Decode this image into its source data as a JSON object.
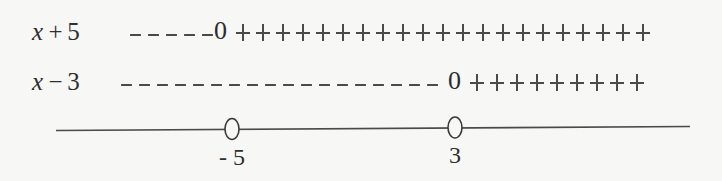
{
  "figure": {
    "type": "sign-chart",
    "background_color": "#f7f7f5",
    "ink_color": "#3a3a3a",
    "rows": [
      {
        "label_variable": "x",
        "label_operator": "+",
        "label_constant": "5",
        "label_text": "x + 5",
        "negative_dash_count": 5,
        "zero_text": "0",
        "zero_at": "-5",
        "positive_plus_count": 21
      },
      {
        "label_variable": "x",
        "label_operator": "−",
        "label_constant": "3",
        "label_text": "x − 3",
        "negative_dash_count": 18,
        "zero_text": "0",
        "zero_at": "3",
        "positive_plus_count": 9
      }
    ],
    "number_line": {
      "marks": [
        {
          "label": "- 5",
          "open_circle": true
        },
        {
          "label": "3",
          "open_circle": true
        }
      ]
    }
  },
  "chart_data": {
    "type": "table",
    "title": "",
    "xlabel": "",
    "ylabel": "",
    "categories": [
      "x + 5",
      "x − 3"
    ],
    "series": [
      {
        "name": "x + 5",
        "zeros": [
          -5
        ],
        "sign_intervals": [
          {
            "interval": "(-∞, -5)",
            "sign": "-"
          },
          {
            "interval": "-5",
            "sign": "0"
          },
          {
            "interval": "(-5, ∞)",
            "sign": "+"
          }
        ],
        "dash_count": 5,
        "plus_count": 21
      },
      {
        "name": "x − 3",
        "zeros": [
          3
        ],
        "sign_intervals": [
          {
            "interval": "(-∞, 3)",
            "sign": "-"
          },
          {
            "interval": "3",
            "sign": "0"
          },
          {
            "interval": "(3, ∞)",
            "sign": "+"
          }
        ],
        "dash_count": 18,
        "plus_count": 9
      }
    ],
    "axis_ticks": [
      "- 5",
      "3"
    ],
    "grid": false,
    "legend": "none"
  }
}
